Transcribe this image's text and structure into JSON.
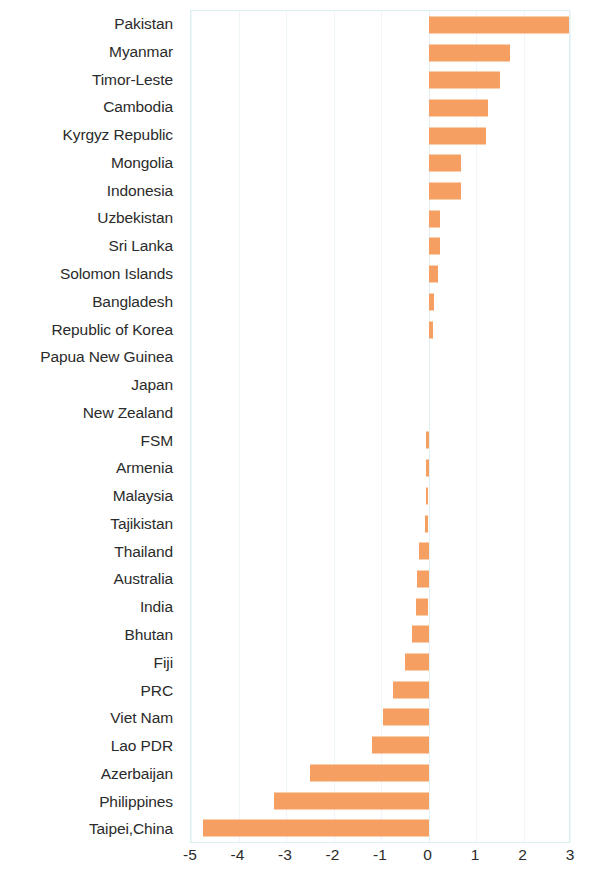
{
  "chart_data": {
    "type": "bar",
    "orientation": "horizontal",
    "title": "",
    "subtitle": "",
    "xlabel": "",
    "ylabel": "",
    "xlim": [
      -5,
      3
    ],
    "xticks": [
      -5,
      -4,
      -3,
      -2,
      -1,
      0,
      1,
      2,
      3
    ],
    "xtick_labels": [
      "-5",
      "-4",
      "-3",
      "-2",
      "-1",
      "0",
      "1",
      "2",
      "3"
    ],
    "grid": true,
    "legend": null,
    "bar_color": "#f5a062",
    "plot_border_color": "#dbeef2",
    "categories": [
      "Pakistan",
      "Myanmar",
      "Timor-Leste",
      "Cambodia",
      "Kyrgyz Republic",
      "Mongolia",
      "Indonesia",
      "Uzbekistan",
      "Sri Lanka",
      "Solomon Islands",
      "Bangladesh",
      "Republic of Korea",
      "Papua New Guinea",
      "Japan",
      "New Zealand",
      "FSM",
      "Armenia",
      "Malaysia",
      "Tajikistan",
      "Thailand",
      "Australia",
      "India",
      "Bhutan",
      "Fiji",
      "PRC",
      "Viet Nam",
      "Lao PDR",
      "Azerbaijan",
      "Philippines",
      "Taipei,China"
    ],
    "values": [
      2.95,
      1.72,
      1.5,
      1.25,
      1.2,
      0.68,
      0.68,
      0.25,
      0.25,
      0.2,
      0.12,
      0.1,
      0.0,
      0.0,
      0.0,
      -0.05,
      -0.05,
      -0.06,
      -0.07,
      -0.2,
      -0.25,
      -0.27,
      -0.35,
      -0.5,
      -0.75,
      -0.95,
      -1.2,
      -2.5,
      -3.25,
      -4.75
    ]
  }
}
